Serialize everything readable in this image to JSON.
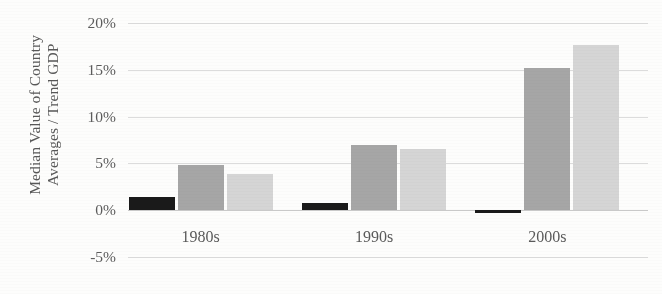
{
  "chart_data": {
    "type": "bar",
    "title": "",
    "subtitle": "",
    "xlabel": "",
    "ylabel": "Median Value of Country Averages / Trend GDP",
    "ylabel_line1": "Median Value of Country",
    "ylabel_line2": "Averages / Trend GDP",
    "categories": [
      "1980s",
      "1990s",
      "2000s"
    ],
    "ylim": [
      -5,
      20
    ],
    "ytick_values": [
      20,
      15,
      10,
      5,
      0,
      -5
    ],
    "ytick_labels": [
      "20%",
      "15%",
      "10%",
      "5%",
      "0%",
      "-5%"
    ],
    "grid": true,
    "legend": "none",
    "series": [
      {
        "name": "series-1",
        "color": "#1a1a1a",
        "values": [
          1.4,
          0.8,
          -0.1
        ]
      },
      {
        "name": "series-2",
        "color": "#a6a6a6",
        "values": [
          4.8,
          7.0,
          15.2
        ]
      },
      {
        "name": "series-3",
        "color": "#d5d5d5",
        "values": [
          3.9,
          6.5,
          17.6
        ]
      }
    ]
  },
  "colors": {
    "background": "#fdfdfc",
    "gridline": "#dcdcdc",
    "axis_text": "#5a5a5a",
    "series_dark": "#1a1a1a",
    "series_mid": "#a6a6a6",
    "series_light": "#d5d5d5"
  }
}
